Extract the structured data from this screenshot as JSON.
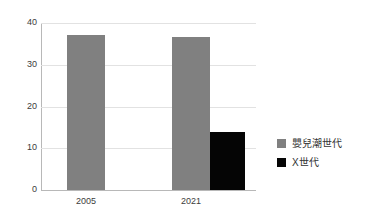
{
  "chart_data": {
    "type": "bar",
    "title": "",
    "subtitle": "",
    "xlabel": "",
    "ylabel": "",
    "categories": [
      "2005",
      "2021"
    ],
    "series": [
      {
        "name": "嬰兒潮世代",
        "color": "#808080",
        "values": [
          37.2,
          36.6
        ]
      },
      {
        "name": "X世代",
        "color": "#050505",
        "values": [
          null,
          13.8
        ]
      }
    ],
    "ylim": [
      0,
      40
    ],
    "yticks": [
      0,
      10,
      20,
      30,
      40
    ],
    "ytick_labels": [
      "0",
      "10",
      "20",
      "30",
      "40"
    ],
    "grid": true,
    "legend_position": "right"
  },
  "axes": {
    "y_tick_0": "0",
    "y_tick_1": "10",
    "y_tick_2": "20",
    "y_tick_3": "30",
    "y_tick_4": "40",
    "x_tick_0": "2005",
    "x_tick_1": "2021"
  },
  "legend": {
    "items": [
      {
        "label": "嬰兒潮世代",
        "color": "#808080"
      },
      {
        "label": "X世代",
        "color": "#050505"
      }
    ]
  },
  "colors": {
    "boomer": "#808080",
    "genx": "#050505",
    "gridline": "#e2e2e2",
    "axis": "#b8b8b8",
    "text": "#3c3c3c",
    "background": "#ffffff"
  }
}
